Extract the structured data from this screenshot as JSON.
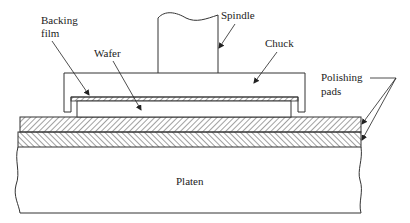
{
  "diagram": {
    "type": "cross-section schematic",
    "labels": {
      "spindle": "Spindle",
      "chuck": "Chuck",
      "backing_film_line1": "Backing",
      "backing_film_line2": "film",
      "wafer": "Wafer",
      "polishing_pads_line1": "Polishing",
      "polishing_pads_line2": "pads",
      "platen": "Platen"
    },
    "components": [
      {
        "name": "Spindle",
        "role": "rotating shaft attached to chuck"
      },
      {
        "name": "Chuck",
        "role": "holds wafer"
      },
      {
        "name": "Backing film",
        "role": "layer between chuck and wafer",
        "hatched": true
      },
      {
        "name": "Wafer",
        "role": "workpiece being polished"
      },
      {
        "name": "Polishing pads",
        "role": "two stacked hatched layers on platen",
        "count": 2
      },
      {
        "name": "Platen",
        "role": "base supporting polishing pads"
      }
    ],
    "colors": {
      "line": "#333333",
      "background": "#ffffff",
      "text": "#222222"
    }
  }
}
